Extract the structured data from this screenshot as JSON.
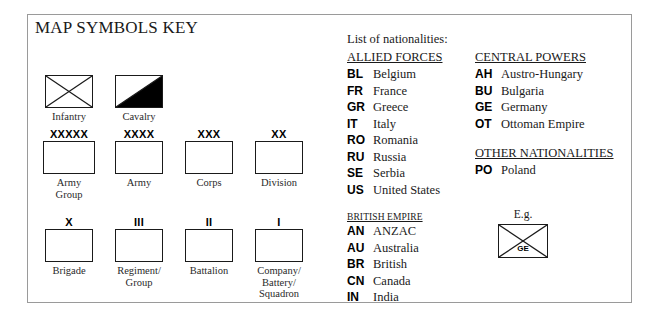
{
  "title": "MAP SYMBOLS KEY",
  "symbol_groups": [
    {
      "id": "group-type",
      "cells": [
        {
          "mark": "",
          "glyph": "infantry",
          "label": "Infantry"
        },
        {
          "mark": "",
          "glyph": "cavalry",
          "label": "Cavalry"
        }
      ]
    },
    {
      "id": "group-large",
      "cells": [
        {
          "mark": "XXXXX",
          "glyph": "plain",
          "label": "Army\nGroup"
        },
        {
          "mark": "XXXX",
          "glyph": "plain",
          "label": "Army"
        },
        {
          "mark": "XXX",
          "glyph": "plain",
          "label": "Corps"
        },
        {
          "mark": "XX",
          "glyph": "plain",
          "label": "Division"
        }
      ]
    },
    {
      "id": "group-small",
      "cells": [
        {
          "mark": "X",
          "glyph": "plain",
          "label": "Brigade"
        },
        {
          "mark": "III",
          "glyph": "plain",
          "label": "Regiment/\nGroup"
        },
        {
          "mark": "II",
          "glyph": "plain",
          "label": "Battalion"
        },
        {
          "mark": "I",
          "glyph": "plain",
          "label": "Company/\nBattery/\nSquadron"
        }
      ]
    }
  ],
  "nationalities": {
    "intro": "List of nationalities:",
    "left_column": [
      {
        "heading": "ALLIED FORCES",
        "heading_size": "normal",
        "entries": [
          {
            "code": "BL",
            "name": "Belgium"
          },
          {
            "code": "FR",
            "name": "France"
          },
          {
            "code": "GR",
            "name": "Greece"
          },
          {
            "code": "IT",
            "name": "Italy"
          },
          {
            "code": "RO",
            "name": "Romania"
          },
          {
            "code": "RU",
            "name": "Russia"
          },
          {
            "code": "SE",
            "name": "Serbia"
          },
          {
            "code": "US",
            "name": "United States"
          }
        ]
      },
      {
        "heading": "BRITISH EMPIRE",
        "heading_size": "small",
        "entries": [
          {
            "code": "AN",
            "name": "ANZAC"
          },
          {
            "code": "AU",
            "name": "Australia"
          },
          {
            "code": "BR",
            "name": "British"
          },
          {
            "code": "CN",
            "name": "Canada"
          },
          {
            "code": "IN",
            "name": "India"
          }
        ]
      }
    ],
    "right_column": [
      {
        "heading": "CENTRAL POWERS",
        "heading_size": "normal",
        "entries": [
          {
            "code": "AH",
            "name": "Austro-Hungary"
          },
          {
            "code": "BU",
            "name": "Bulgaria"
          },
          {
            "code": "GE",
            "name": "Germany"
          },
          {
            "code": "OT",
            "name": "Ottoman Empire"
          }
        ]
      },
      {
        "heading": "OTHER NATIONALITIES",
        "heading_size": "normal",
        "entries": [
          {
            "code": "PO",
            "name": "Poland"
          }
        ]
      }
    ]
  },
  "example": {
    "caption": "E.g.",
    "glyph": "infantry",
    "code": "GE"
  },
  "colors": {
    "ink": "#1a1a1a",
    "frame": "#9a9a9a",
    "fill": "#000000"
  }
}
